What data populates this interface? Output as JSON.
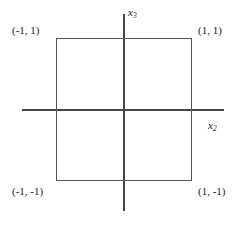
{
  "figure": {
    "background_color": "#ffffff",
    "line_color": "#464646",
    "square_color": "#555555"
  },
  "axes": {
    "vertical": {
      "label_var": "x",
      "label_sub": "3",
      "name": "x3"
    },
    "horizontal": {
      "label_var": "x",
      "label_sub": "2",
      "name": "x2"
    }
  },
  "corners": {
    "top_left": "(-1, 1)",
    "top_right": "(1, 1)",
    "bottom_left": "(-1, -1)",
    "bottom_right": "(1, -1)"
  },
  "chart_data": {
    "type": "scatter",
    "title": "",
    "xlabel": "x2",
    "ylabel": "x3",
    "xlim": [
      -1.5,
      1.5
    ],
    "ylim": [
      -1.5,
      1.5
    ],
    "grid": false,
    "legend": "none",
    "annotations": [
      {
        "text": "(-1, 1)",
        "x": -1,
        "y": 1
      },
      {
        "text": "(1, 1)",
        "x": 1,
        "y": 1
      },
      {
        "text": "(-1, -1)",
        "x": -1,
        "y": -1
      },
      {
        "text": "(1, -1)",
        "x": 1,
        "y": -1
      }
    ],
    "shapes": [
      {
        "kind": "square",
        "vertices": [
          [
            -1,
            1
          ],
          [
            1,
            1
          ],
          [
            1,
            -1
          ],
          [
            -1,
            -1
          ]
        ],
        "filled": false
      }
    ]
  }
}
